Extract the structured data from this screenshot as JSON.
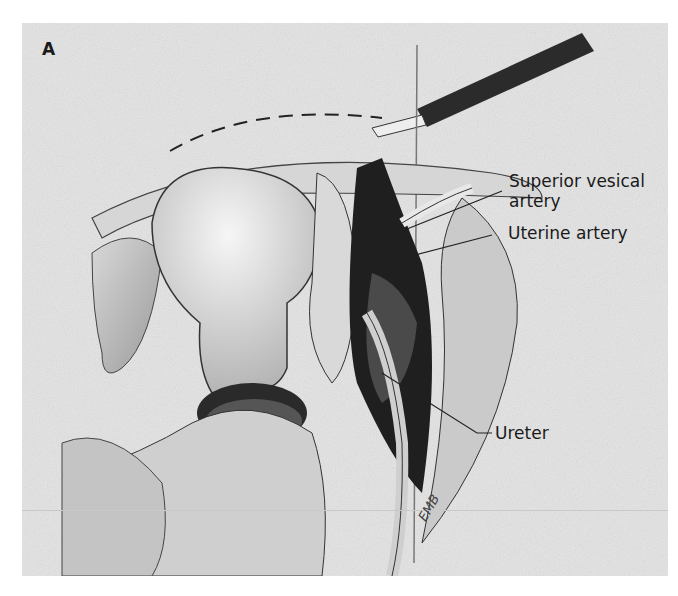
{
  "figure": {
    "panel_letter": "A",
    "labels": {
      "superior_vesical_line1": "Superior vesical",
      "superior_vesical_line2": "artery",
      "uterine": "Uterine artery",
      "ureter": "Ureter"
    },
    "artist_signature": "EMB"
  }
}
